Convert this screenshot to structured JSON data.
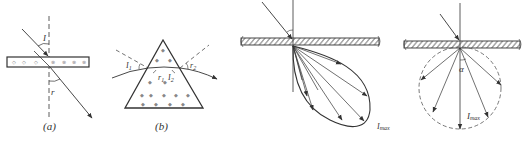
{
  "colors": {
    "stroke": "#333333",
    "hatch": "#555555",
    "background": "#ffffff",
    "speckle": "#777777"
  },
  "panels": {
    "a": {
      "caption": "(a)",
      "incident_angle_label": "I",
      "refraction_angle_label": "r"
    },
    "b": {
      "caption": "(b)",
      "labels": {
        "I1": "I",
        "I1_sub": "1",
        "r1": "r",
        "r1_sub": "1",
        "I2": "I",
        "I2_sub": "2",
        "r2": "r",
        "r2_sub": "2"
      }
    },
    "c": {
      "intensity_label": "I",
      "intensity_sub": "max"
    },
    "d": {
      "angle_label": "α",
      "intensity_label": "I",
      "intensity_sub": "max"
    }
  }
}
